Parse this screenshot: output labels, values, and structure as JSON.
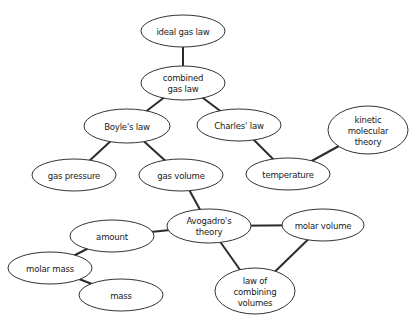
{
  "diagram": {
    "type": "concept-map",
    "nodes": [
      {
        "id": "ideal_gas_law",
        "lines": [
          "ideal gas law"
        ],
        "cx": 183,
        "cy": 31,
        "rx": 42,
        "ry": 16
      },
      {
        "id": "combined_gas_law",
        "lines": [
          "combined",
          "gas law"
        ],
        "cx": 183,
        "cy": 83,
        "rx": 42,
        "ry": 17
      },
      {
        "id": "boyles_law",
        "lines": [
          "Boyle's law"
        ],
        "cx": 127,
        "cy": 126,
        "rx": 43,
        "ry": 17
      },
      {
        "id": "charles_law",
        "lines": [
          "Charles' law"
        ],
        "cx": 239,
        "cy": 125,
        "rx": 42,
        "ry": 16
      },
      {
        "id": "kinetic_molecular_theory",
        "lines": [
          "kinetic",
          "molecular",
          "theory"
        ],
        "cx": 368,
        "cy": 130,
        "rx": 40,
        "ry": 24
      },
      {
        "id": "gas_pressure",
        "lines": [
          "gas pressure"
        ],
        "cx": 74,
        "cy": 175,
        "rx": 42,
        "ry": 16
      },
      {
        "id": "gas_volume",
        "lines": [
          "gas volume"
        ],
        "cx": 181,
        "cy": 175,
        "rx": 42,
        "ry": 16
      },
      {
        "id": "temperature",
        "lines": [
          "temperature"
        ],
        "cx": 288,
        "cy": 174,
        "rx": 42,
        "ry": 16
      },
      {
        "id": "avogadros_theory",
        "lines": [
          "Avogadro's",
          "theory"
        ],
        "cx": 209,
        "cy": 226,
        "rx": 42,
        "ry": 17
      },
      {
        "id": "molar_volume",
        "lines": [
          "molar volume"
        ],
        "cx": 323,
        "cy": 225,
        "rx": 41,
        "ry": 16
      },
      {
        "id": "amount",
        "lines": [
          "amount"
        ],
        "cx": 112,
        "cy": 236,
        "rx": 42,
        "ry": 16
      },
      {
        "id": "molar_mass",
        "lines": [
          "molar mass"
        ],
        "cx": 50,
        "cy": 268,
        "rx": 42,
        "ry": 16
      },
      {
        "id": "mass",
        "lines": [
          "mass"
        ],
        "cx": 121,
        "cy": 295,
        "rx": 42,
        "ry": 16
      },
      {
        "id": "law_of_combining_volumes",
        "lines": [
          "law of",
          "combining",
          "volumes"
        ],
        "cx": 255,
        "cy": 291,
        "rx": 40,
        "ry": 23
      }
    ],
    "edges": [
      [
        "ideal_gas_law",
        "combined_gas_law"
      ],
      [
        "combined_gas_law",
        "boyles_law"
      ],
      [
        "combined_gas_law",
        "charles_law"
      ],
      [
        "boyles_law",
        "gas_pressure"
      ],
      [
        "boyles_law",
        "gas_volume"
      ],
      [
        "charles_law",
        "temperature"
      ],
      [
        "temperature",
        "kinetic_molecular_theory"
      ],
      [
        "gas_volume",
        "avogadros_theory"
      ],
      [
        "avogadros_theory",
        "amount"
      ],
      [
        "avogadros_theory",
        "molar_volume"
      ],
      [
        "avogadros_theory",
        "law_of_combining_volumes"
      ],
      [
        "molar_volume",
        "law_of_combining_volumes"
      ],
      [
        "amount",
        "molar_mass"
      ],
      [
        "molar_mass",
        "mass"
      ]
    ]
  }
}
